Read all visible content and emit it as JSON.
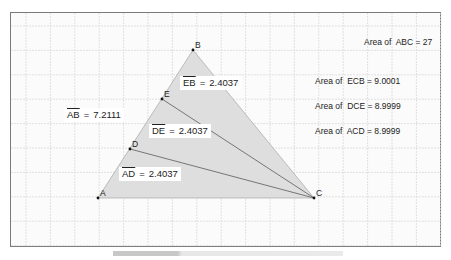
{
  "diagram": {
    "type": "geometry-triangle-area-division",
    "grid": {
      "spacing": 24.4,
      "origin_x": 10,
      "origin_y": 12,
      "color": "#d9d9d9"
    },
    "frame": {
      "x": 10,
      "y": 12,
      "width": 431,
      "height": 235
    },
    "colors": {
      "fill": "#dedede",
      "stroke": "#5a5a5a",
      "point": "#111111",
      "label_bg": "#ffffff"
    },
    "points": {
      "A": {
        "label": "A",
        "x": 98,
        "y": 198
      },
      "B": {
        "label": "B",
        "x": 193,
        "y": 50
      },
      "C": {
        "label": "C",
        "x": 314,
        "y": 198
      },
      "D": {
        "label": "D",
        "x": 130,
        "y": 149
      },
      "E": {
        "label": "E",
        "x": 162,
        "y": 99
      }
    },
    "segments": [
      {
        "from": "D",
        "to": "C"
      },
      {
        "from": "E",
        "to": "C"
      }
    ],
    "measurements": [
      {
        "segment": "AB",
        "value": "7.2111",
        "x": 64,
        "y": 108
      },
      {
        "segment": "EB",
        "value": "2.4037",
        "x": 180,
        "y": 76
      },
      {
        "segment": "DE",
        "value": "2.4037",
        "x": 149,
        "y": 124
      },
      {
        "segment": "AD",
        "value": "2.4037",
        "x": 119,
        "y": 167
      }
    ],
    "areas": [
      {
        "prefix": "Area of",
        "name": "ABC",
        "value": "27",
        "x": 364,
        "y": 38
      },
      {
        "prefix": "Area of",
        "name": "ECB",
        "value": "9.0001",
        "x": 315,
        "y": 77
      },
      {
        "prefix": "Area of",
        "name": "DCE",
        "value": "8.9999",
        "x": 315,
        "y": 102
      },
      {
        "prefix": "Area of",
        "name": "ACD",
        "value": "8.9999",
        "x": 315,
        "y": 127
      }
    ],
    "equals": "="
  }
}
